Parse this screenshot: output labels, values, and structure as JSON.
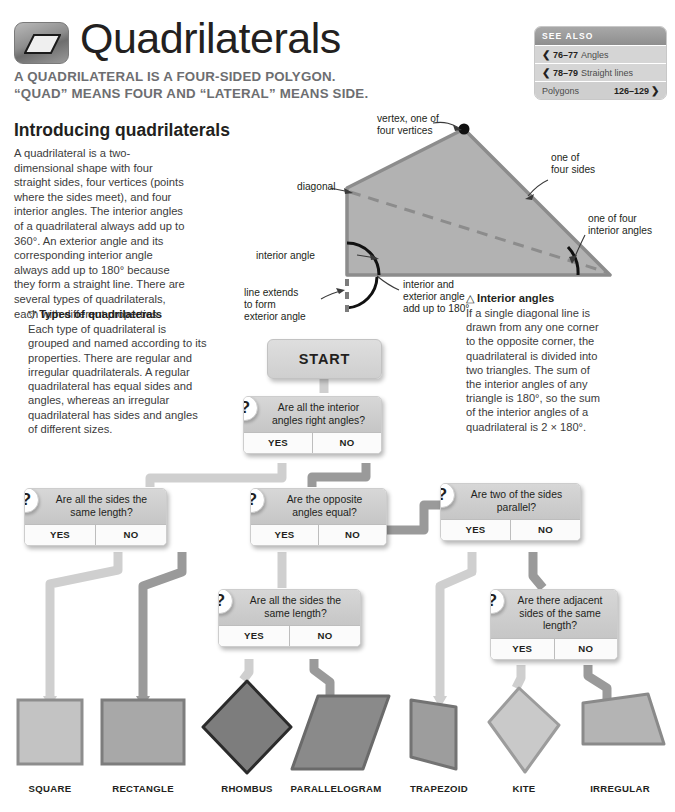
{
  "header": {
    "title": "Quadrilaterals",
    "icon": "parallelogram-icon",
    "subtitle_line1": "A QUADRILATERAL IS A FOUR-SIDED POLYGON.",
    "subtitle_line2": "“QUAD” MEANS FOUR AND “LATERAL” MEANS SIDE."
  },
  "see_also": {
    "heading": "SEE ALSO",
    "rows": [
      {
        "pages": "76–77",
        "label": "Angles",
        "arrow": "❮",
        "arrow_side": "left"
      },
      {
        "pages": "78–79",
        "label": "Straight lines",
        "arrow": "❮",
        "arrow_side": "left"
      },
      {
        "pages": "126–129",
        "label": "Polygons",
        "arrow": "❯",
        "arrow_side": "right"
      }
    ]
  },
  "intro": {
    "heading": "Introducing quadrilaterals",
    "body": "A quadrilateral is a two-dimensional shape with four straight sides, four vertices (points where the sides meet), and four interior angles. The interior angles of a quadrilateral always add up to 360°. An exterior angle and its corresponding interior angle always add up to 180° because they form a straight line. There are several types of quadrilaterals, each with different properties."
  },
  "types": {
    "marker": "▽",
    "heading": "Types of quadrilaterals",
    "body": "Each type of quadrilateral is grouped and named according to its properties. There are regular and irregular quadrilaterals. A regular quadrilateral has equal sides and angles, whereas an irregular quadrilateral has sides and angles of different sizes."
  },
  "diagram": {
    "labels": {
      "vertex": "vertex, one of\nfour vertices",
      "vertex_l1": "vertex, one of",
      "vertex_l2": "four vertices",
      "one_of_four_sides_l1": "one of",
      "one_of_four_sides_l2": "four sides",
      "diagonal": "diagonal",
      "one_of_four_interior_l1": "one of four",
      "one_of_four_interior_l2": "interior angles",
      "interior_angle": "interior angle",
      "line_extends_l1": "line extends",
      "line_extends_l2": "to form",
      "line_extends_l3": "exterior angle",
      "int_ext_l1": "interior and",
      "int_ext_l2": "exterior angle",
      "int_ext_l3": "add up to 180°"
    },
    "caption": {
      "marker": "△",
      "heading": "Interior angles",
      "body": "If a single diagonal line is drawn from any one corner to the opposite corner, the quadrilateral is divided into two triangles. The sum of the interior angles of any triangle is 180°, so the sum of the interior angles of a quadrilateral is 2 × 180°."
    },
    "fill": "#b2b2b2",
    "stroke": "#8c8c8c"
  },
  "flowchart": {
    "start_label": "START",
    "yes_label": "YES",
    "no_label": "NO",
    "question_marker": "?",
    "nodes": [
      {
        "id": "q1",
        "question_l1": "Are all the interior",
        "question_l2": "angles right angles?"
      },
      {
        "id": "q2",
        "question_l1": "Are all the sides the",
        "question_l2": "same length?"
      },
      {
        "id": "q3",
        "question_l1": "Are the opposite",
        "question_l2": "angles equal?"
      },
      {
        "id": "q4",
        "question_l1": "Are two of the sides",
        "question_l2": "parallel?"
      },
      {
        "id": "q5",
        "question_l1": "Are all the sides the",
        "question_l2": "same length?"
      },
      {
        "id": "q6",
        "question_l1": "Are there adjacent",
        "question_l2": "sides of the same",
        "question_l3": "length?"
      }
    ]
  },
  "shapes": [
    {
      "name": "SQUARE",
      "fill": "#c3c3c3",
      "stroke": "#8d8d8d"
    },
    {
      "name": "RECTANGLE",
      "fill": "#a8a8a8",
      "stroke": "#7d7d7d"
    },
    {
      "name": "RHOMBUS",
      "fill": "#7d7d7d",
      "stroke": "#2b2b2b"
    },
    {
      "name": "PARALLELOGRAM",
      "fill": "#8a8a8a",
      "stroke": "#6a6a6a"
    },
    {
      "name": "TRAPEZOID",
      "fill": "#9d9d9d",
      "stroke": "#737373"
    },
    {
      "name": "KITE",
      "fill": "#c9c9c9",
      "stroke": "#9c9c9c"
    },
    {
      "name": "IRREGULAR",
      "fill": "#b4b4b4",
      "stroke": "#8a8a8a"
    }
  ],
  "colors": {
    "connector_light": "#cfcfcf",
    "connector_dark": "#8f8f8f",
    "text": "#231f20",
    "muted": "#6d6e71"
  }
}
